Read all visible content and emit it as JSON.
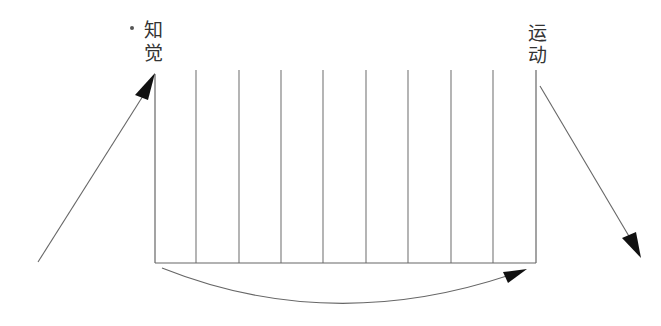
{
  "diagram": {
    "labels": {
      "left_top": "知",
      "left_bottom": "觉",
      "right_top": "运",
      "right_bottom": "动"
    },
    "columns": {
      "count": 9,
      "x_positions": [
        155,
        196,
        239,
        281,
        323,
        366,
        408,
        451,
        493,
        536
      ],
      "top_y": 70,
      "bottom_y": 263
    },
    "arrows": {
      "input": {
        "from": [
          38,
          262
        ],
        "to": [
          155,
          74
        ],
        "direction": "up-right"
      },
      "output": {
        "from": [
          540,
          86
        ],
        "to": [
          641,
          257
        ],
        "direction": "down-right"
      },
      "bottom_curve": {
        "from": [
          162,
          268
        ],
        "to": [
          526,
          272
        ],
        "direction": "left-to-right"
      }
    },
    "colors": {
      "line": "#666666",
      "arrowhead": "#111111",
      "text": "#333333"
    }
  }
}
